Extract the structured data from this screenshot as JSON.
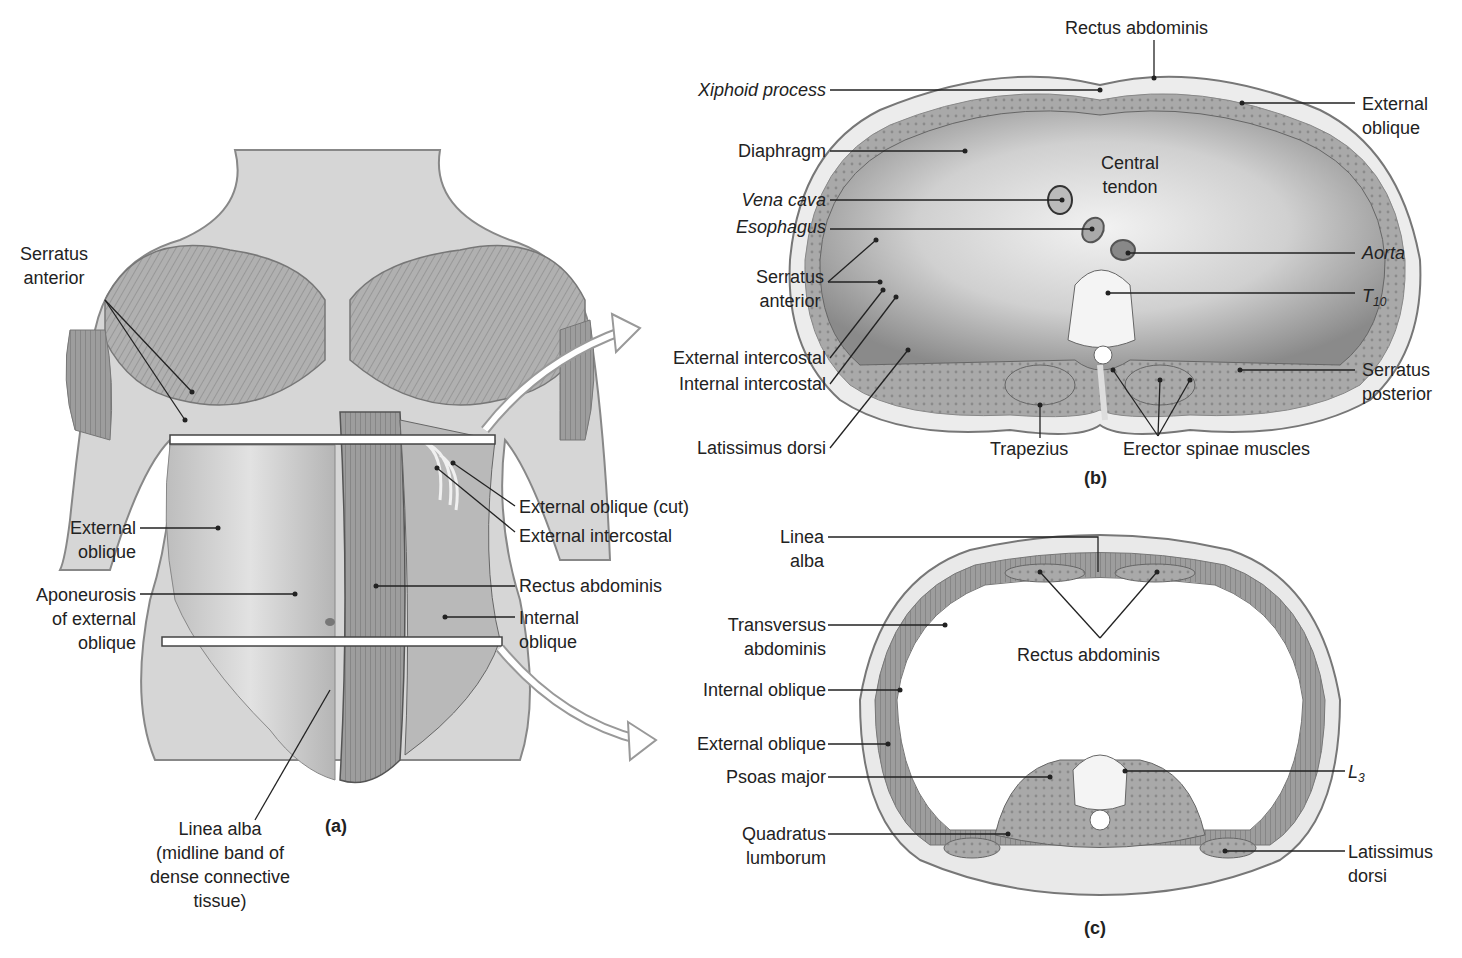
{
  "figure": {
    "panel_a": {
      "caption": "(a)",
      "labels": {
        "serratus_anterior": [
          "Serratus",
          "anterior"
        ],
        "external_oblique": [
          "External",
          "oblique"
        ],
        "aponeurosis": [
          "Aponeurosis",
          "of external",
          "oblique"
        ],
        "linea_alba": [
          "Linea alba",
          "(midline band of",
          "dense connective",
          "tissue)"
        ],
        "external_oblique_cut": "External oblique (cut)",
        "external_intercostal": "External intercostal",
        "rectus_abdominis": "Rectus abdominis",
        "internal_oblique": [
          "Internal",
          "oblique"
        ]
      }
    },
    "panel_b": {
      "caption": "(b)",
      "labels": {
        "rectus_abdominis": "Rectus abdominis",
        "xiphoid_process": "Xiphoid process",
        "external_oblique": [
          "External",
          "oblique"
        ],
        "diaphragm": "Diaphragm",
        "central_tendon": [
          "Central",
          "tendon"
        ],
        "vena_cava": "Vena cava",
        "esophagus": "Esophagus",
        "aorta": "Aorta",
        "serratus_anterior": [
          "Serratus",
          "anterior"
        ],
        "t10": "T",
        "t10_sub": "10",
        "external_intercostal": "External intercostal",
        "internal_intercostal": "Internal intercostal",
        "serratus_posterior": [
          "Serratus",
          "posterior"
        ],
        "latissimus_dorsi": "Latissimus dorsi",
        "trapezius": "Trapezius",
        "erector_spinae": "Erector spinae muscles"
      }
    },
    "panel_c": {
      "caption": "(c)",
      "labels": {
        "linea_alba": [
          "Linea",
          "alba"
        ],
        "transversus_abdominis": [
          "Transversus",
          "abdominis"
        ],
        "rectus_abdominis": "Rectus abdominis",
        "internal_oblique": "Internal oblique",
        "external_oblique": "External oblique",
        "psoas_major": "Psoas major",
        "l3": "L",
        "l3_sub": "3",
        "quadratus_lumborum": [
          "Quadratus",
          "lumborum"
        ],
        "latissimus_dorsi": [
          "Latissimus",
          "dorsi"
        ]
      }
    },
    "colors": {
      "muscle_dark": "#7a7a7a",
      "muscle_mid": "#a8a8a8",
      "muscle_light": "#cfcfcf",
      "skin": "#e6e6e6",
      "line": "#222222",
      "background": "#ffffff"
    }
  }
}
